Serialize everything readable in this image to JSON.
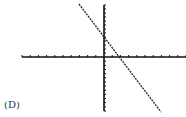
{
  "label": "(D)",
  "colors": {
    "axis": "#111111",
    "line": "#222222",
    "background": "#ffffff"
  },
  "chart_data": {
    "type": "line",
    "title": "",
    "xlabel": "",
    "ylabel": "",
    "panel_label": "(D)",
    "grid": false,
    "legend": null,
    "axes": {
      "x_ticks_left_of_origin": 10,
      "x_ticks_right_of_origin": 10,
      "y_ticks_above_origin": 13,
      "y_ticks_below_origin": 13,
      "tick_labels": []
    },
    "xlim": [
      -10,
      10
    ],
    "ylim": [
      -13,
      13
    ],
    "series": [
      {
        "name": "line",
        "description": "straight line with negative slope, positive y-intercept, positive x-intercept",
        "approx_slope": -2.5,
        "approx_y_intercept": 5,
        "approx_x_intercept": 2,
        "x": [
          -3,
          7
        ],
        "y": [
          13,
          -13
        ]
      }
    ]
  }
}
